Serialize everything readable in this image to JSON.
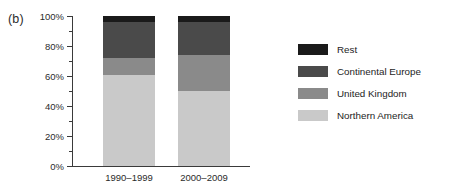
{
  "panel": {
    "label": "(b)"
  },
  "chart_data": {
    "type": "bar",
    "title": "",
    "subtitle": "",
    "xlabel": "",
    "ylabel": "",
    "stacked": true,
    "orientation": "vertical",
    "grid": false,
    "legend_position": "right",
    "categories": [
      "1990–1999",
      "2000–2009"
    ],
    "ylim": [
      0,
      100
    ],
    "yticks": [
      0,
      20,
      40,
      60,
      80,
      100
    ],
    "ytick_labels": [
      "0%",
      "20%",
      "40%",
      "60%",
      "80%",
      "100%"
    ],
    "yminor_ticks": [
      10,
      30,
      50,
      70,
      90
    ],
    "yunit": "%",
    "series": [
      {
        "name": "Northern America",
        "color": "#c9c9c9",
        "values": [
          61,
          50
        ],
        "stack_order": 1
      },
      {
        "name": "United Kingdom",
        "color": "#8a8a8a",
        "values": [
          11,
          24
        ],
        "stack_order": 2
      },
      {
        "name": "Continental Europe",
        "color": "#4a4a4a",
        "values": [
          24,
          22
        ],
        "stack_order": 3
      },
      {
        "name": "Rest",
        "color": "#1a1a1a",
        "values": [
          4,
          4
        ],
        "stack_order": 4
      }
    ],
    "legend_entries": [
      {
        "label": "Rest",
        "color": "#1a1a1a"
      },
      {
        "label": "Continental Europe",
        "color": "#4a4a4a"
      },
      {
        "label": "United Kingdom",
        "color": "#8a8a8a"
      },
      {
        "label": "Northern America",
        "color": "#c9c9c9"
      }
    ]
  }
}
